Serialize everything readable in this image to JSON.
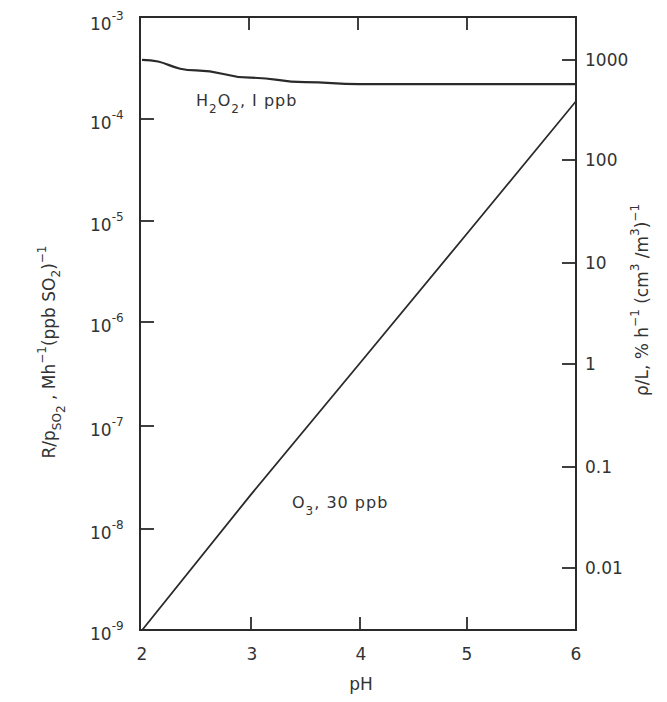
{
  "chart_data": {
    "type": "line",
    "title": "",
    "xlabel": "pH",
    "ylabel_left": "R/p_SO2 , Mh^-1 (ppb SO2)^-1",
    "ylabel_right": "ρ/L, % h^-1 (cm^3 /m^3)^-1",
    "x_ticks": [
      "2",
      "3",
      "4",
      "5",
      "6"
    ],
    "xlim": [
      2,
      6
    ],
    "y_left_scale": "log",
    "y_left_lim": [
      1e-09,
      0.001
    ],
    "y_left_ticks": [
      {
        "base": "10",
        "exp": "-3"
      },
      {
        "base": "10",
        "exp": "-4"
      },
      {
        "base": "10",
        "exp": "-5"
      },
      {
        "base": "10",
        "exp": "-6"
      },
      {
        "base": "10",
        "exp": "-7"
      },
      {
        "base": "10",
        "exp": "-8"
      },
      {
        "base": "10",
        "exp": "-9"
      }
    ],
    "y_right_scale": "log",
    "y_right_ticks": [
      "1000",
      "100",
      "10",
      "1",
      "0.1",
      "0.01"
    ],
    "grid": false,
    "series": [
      {
        "name": "H2O2, 1 ppb",
        "label_main": "H",
        "label_sub1": "2",
        "label_mid": "O",
        "label_sub2": "2",
        "label_tail": ",  I ppb",
        "x": [
          2.0,
          2.5,
          3.0,
          3.5,
          4.0,
          4.5,
          5.0,
          5.5,
          6.0
        ],
        "values": [
          0.00038,
          0.0003,
          0.000255,
          0.00023,
          0.00022,
          0.00022,
          0.00022,
          0.00022,
          0.00022
        ]
      },
      {
        "name": "O3, 30 ppb",
        "label_main": "O",
        "label_sub1": "3",
        "label_tail": ",  30 ppb",
        "x": [
          2,
          3,
          4,
          5,
          6
        ],
        "values": [
          1e-09,
          2.1e-08,
          4e-07,
          7.7e-06,
          0.00015
        ]
      }
    ]
  }
}
